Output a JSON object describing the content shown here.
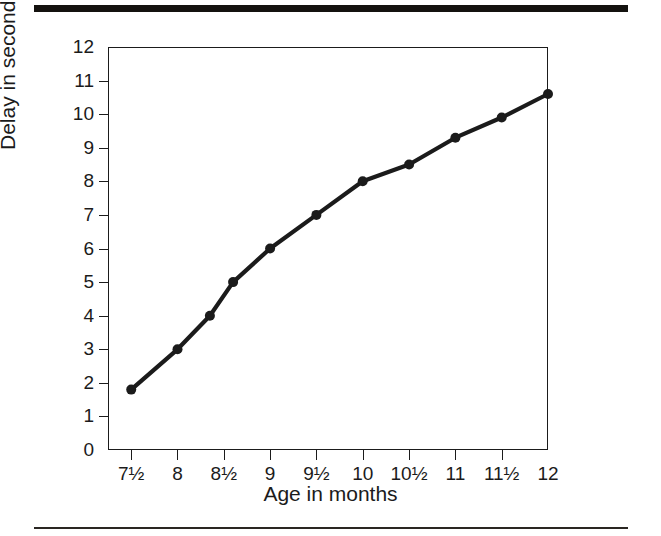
{
  "figure": {
    "top_rule": "",
    "bottom_rule": "",
    "ink_color": "#1b1b1b"
  },
  "chart_data": {
    "type": "line",
    "title": "",
    "xlabel": "Age in months",
    "ylabel": "Delay in seconds",
    "xlim": [
      7.25,
      12.0
    ],
    "ylim": [
      0,
      12
    ],
    "grid": false,
    "legend": false,
    "marker": "filled-circle",
    "line_color": "#1b1b1b",
    "x_tick_labels": [
      "7½",
      "8",
      "8½",
      "9",
      "9½",
      "10",
      "10½",
      "11",
      "11½",
      "12"
    ],
    "x_tick_values": [
      7.5,
      8,
      8.5,
      9,
      9.5,
      10,
      10.5,
      11,
      11.5,
      12
    ],
    "y_tick_labels": [
      "0",
      "1",
      "2",
      "3",
      "4",
      "5",
      "6",
      "7",
      "8",
      "9",
      "10",
      "11",
      "12"
    ],
    "y_tick_values": [
      0,
      1,
      2,
      3,
      4,
      5,
      6,
      7,
      8,
      9,
      10,
      11,
      12
    ],
    "x": [
      7.5,
      8.0,
      8.35,
      8.6,
      9.0,
      9.5,
      10.0,
      10.5,
      11.0,
      11.5,
      12.0
    ],
    "values": [
      1.8,
      3.0,
      4.0,
      5.0,
      6.0,
      7.0,
      8.0,
      8.5,
      9.3,
      9.9,
      10.6
    ],
    "points": [
      {
        "x": 7.5,
        "y": 1.8,
        "label": "7½"
      },
      {
        "x": 8.0,
        "y": 3.0,
        "label": "8"
      },
      {
        "x": 8.35,
        "y": 4.0,
        "label": ""
      },
      {
        "x": 8.6,
        "y": 5.0,
        "label": ""
      },
      {
        "x": 9.0,
        "y": 6.0,
        "label": "9"
      },
      {
        "x": 9.5,
        "y": 7.0,
        "label": "9½"
      },
      {
        "x": 10.0,
        "y": 8.0,
        "label": "10"
      },
      {
        "x": 10.5,
        "y": 8.5,
        "label": "10½"
      },
      {
        "x": 11.0,
        "y": 9.3,
        "label": "11"
      },
      {
        "x": 11.5,
        "y": 9.9,
        "label": "11½"
      },
      {
        "x": 12.0,
        "y": 10.6,
        "label": "12"
      }
    ]
  }
}
